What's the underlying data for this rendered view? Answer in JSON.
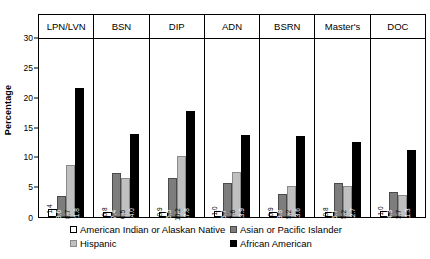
{
  "chart_data": {
    "type": "bar",
    "title": "",
    "xlabel": "",
    "ylabel": "Percentage",
    "ylim": [
      0,
      30
    ],
    "yticks": [
      0,
      5,
      10,
      15,
      20,
      25,
      30
    ],
    "grid": false,
    "legend_position": "bottom",
    "categories": [
      "LPN/LVN",
      "BSN",
      "DIP",
      "ADN",
      "BSRN",
      "Master's",
      "DOC"
    ],
    "series": [
      {
        "name": "American Indian or Alaskan Native",
        "color": "#ffffff",
        "values": [
          1.4,
          0.8,
          0.9,
          1.0,
          0.9,
          0.8,
          1.0
        ]
      },
      {
        "name": "Asian or Pacific Islander",
        "color": "#7d7d7d",
        "values": [
          3.6,
          7.4,
          6.5,
          5.7,
          3.8,
          5.7,
          4.3
        ]
      },
      {
        "name": "Hispanic",
        "color": "#c0c0c0",
        "values": [
          8.7,
          6.5,
          10.2,
          7.6,
          5.2,
          5.2,
          3.7
        ]
      },
      {
        "name": "African American",
        "color": "#000000",
        "values": [
          21.8,
          14.0,
          17.8,
          13.9,
          13.6,
          12.7,
          11.3
        ]
      }
    ],
    "data_labels": [
      [
        "1.4",
        "3.6",
        "8.7",
        "21.8"
      ],
      [
        "0.8",
        "7.4",
        "6.5",
        "14.0"
      ],
      [
        "0.9",
        "6.5",
        "10.2",
        "17.8"
      ],
      [
        "1.0",
        "5.7",
        "7.6",
        "13.9"
      ],
      [
        "0.9",
        "3.8",
        "5.2",
        "13.6"
      ],
      [
        "0.8",
        "5.7",
        "5.2",
        "12.7"
      ],
      [
        "1.0",
        "4.3",
        "3.7",
        "11.3"
      ]
    ]
  },
  "legend": {
    "items": [
      {
        "label": "American Indian or Alaskan Native",
        "swatch": "sw0"
      },
      {
        "label": "Hispanic",
        "swatch": "sw2"
      },
      {
        "label": "Asian or Pacific Islander",
        "swatch": "sw1"
      },
      {
        "label": "African American",
        "swatch": "sw3"
      }
    ]
  },
  "axis": {
    "y_title": "Percentage",
    "tick_30": "30",
    "tick_25": "25",
    "tick_20": "20",
    "tick_15": "15",
    "tick_10": "10",
    "tick_5": "5",
    "tick_0": "0"
  }
}
